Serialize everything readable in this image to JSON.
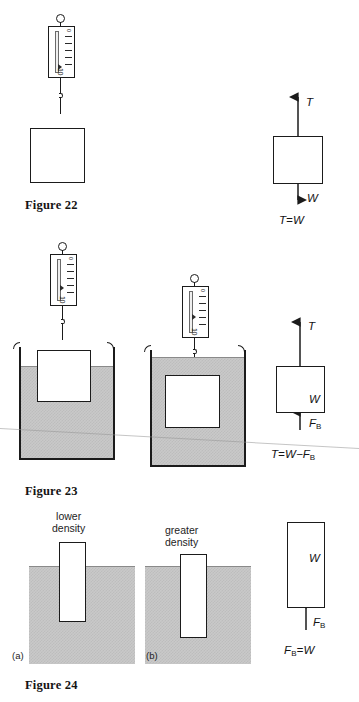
{
  "document": {
    "type": "physics-textbook-figure-plate",
    "subject": "Buoyancy, tension and Archimedes' principle"
  },
  "figures": [
    {
      "id": "figure-22",
      "caption": "Figure 22",
      "description": "Block hanging in air from a spring scale",
      "scale": {
        "top_number": "0",
        "bottom_number": "10"
      },
      "fbd": {
        "up_force": "T",
        "down_force": "W",
        "equation_lhs": "T",
        "equation_rel": "=",
        "equation_rhs": "W",
        "equation": "T=W"
      }
    },
    {
      "id": "figure-23",
      "caption": "Figure 23",
      "description": "Block partially and fully submerged in fluid, hung from spring scales",
      "panels": [
        {
          "label": "",
          "state": "partially submerged",
          "scale": {
            "top_number": "0",
            "bottom_number": "10"
          }
        },
        {
          "label": "",
          "state": "fully submerged",
          "scale": {
            "top_number": "0",
            "bottom_number": "10"
          }
        }
      ],
      "fbd": {
        "up_force": "T",
        "down_force": "W",
        "buoyant_force": "F",
        "buoyant_subscript": "B",
        "equation": "T=W−F",
        "equation_subscript": "B"
      }
    },
    {
      "id": "figure-24",
      "caption": "Figure 24",
      "description": "Two floating blocks of different density and the free-body diagram of a floating block",
      "panels": [
        {
          "tag": "(a)",
          "label_line1": "lower",
          "label_line2": "density"
        },
        {
          "tag": "(b)",
          "label_line1": "greater",
          "label_line2": "density"
        }
      ],
      "fbd": {
        "down_force": "W",
        "buoyant_force": "F",
        "buoyant_subscript": "B",
        "equation_lhs": "F",
        "equation_lhs_sub": "B",
        "equation_rhs": "=W",
        "equation": "Fᴮ=W"
      }
    }
  ],
  "colors": {
    "ink": "#1b1b1b",
    "fluid": "#c9c9c9",
    "fluid_dither": "#bdbdbd",
    "fluid_surface": "#8a8a8a",
    "paper": "#ffffff"
  }
}
